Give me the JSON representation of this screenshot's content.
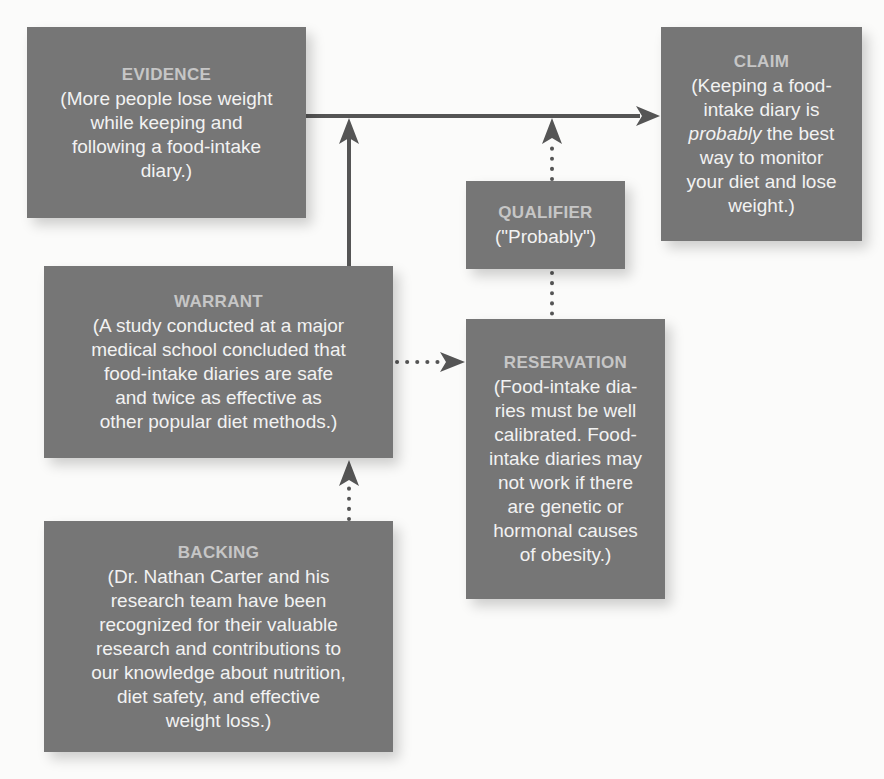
{
  "diagram": {
    "type": "Toulmin argument model",
    "colors": {
      "box_fill": "#767676",
      "box_title": "#c6c6c6",
      "box_text": "#f2f2f2",
      "arrow": "#555555",
      "background": "#fbfbfa"
    },
    "nodes": {
      "evidence": {
        "title": "EVIDENCE",
        "text": "(More people lose weight\nwhile keeping and\nfollowing a food-intake\ndiary.)"
      },
      "claim": {
        "title": "CLAIM",
        "text_before": "(Keeping a food-\nintake diary is\n",
        "text_emphasis": "probably",
        "text_after": " the best\nway to monitor\nyour diet and lose\nweight.)"
      },
      "qualifier": {
        "title": "QUALIFIER",
        "text": "(\"Probably\")"
      },
      "warrant": {
        "title": "WARRANT",
        "text": "(A study conducted at a major\nmedical school concluded that\nfood-intake diaries are safe\nand twice as effective as\nother popular diet methods.)"
      },
      "reservation": {
        "title": "RESERVATION",
        "text": "(Food-intake dia-\nries must be well\ncalibrated. Food-\nintake diaries may\nnot work if there\nare genetic or\nhormonal causes\nof obesity.)"
      },
      "backing": {
        "title": "BACKING",
        "text": "(Dr. Nathan Carter and his\nresearch team have been\nrecognized for their valuable\nresearch and contributions to\nour knowledge about nutrition,\ndiet safety, and effective\nweight loss.)"
      }
    },
    "edges": [
      {
        "from": "evidence",
        "to": "claim",
        "style": "solid"
      },
      {
        "from": "warrant",
        "to": "evidence-claim-line",
        "style": "solid"
      },
      {
        "from": "qualifier",
        "to": "evidence-claim-line",
        "style": "dotted"
      },
      {
        "from": "reservation",
        "to": "qualifier",
        "style": "dotted"
      },
      {
        "from": "warrant",
        "to": "reservation",
        "style": "dotted"
      },
      {
        "from": "backing",
        "to": "warrant",
        "style": "dotted"
      }
    ]
  }
}
